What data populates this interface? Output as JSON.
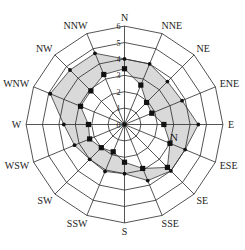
{
  "chart_data": {
    "type": "radar",
    "title": "",
    "categories": [
      "N",
      "NNE",
      "NE",
      "ENE",
      "E",
      "ESE",
      "SE",
      "SSE",
      "S",
      "SSW",
      "SW",
      "WSW",
      "W",
      "WNW",
      "NW",
      "NNW"
    ],
    "radial_ticks": [
      "0",
      "1",
      "2",
      "3",
      "4",
      "5",
      "6"
    ],
    "rlim": [
      0,
      6
    ],
    "grid": true,
    "grid_shape": "polygon",
    "series": [
      {
        "name": "outer (circle markers)",
        "marker": "circle",
        "values": [
          4.0,
          4.0,
          3.7,
          3.8,
          4.5,
          4.0,
          4.0,
          3.7,
          3.0,
          3.1,
          3.0,
          3.3,
          3.7,
          4.9,
          4.7,
          4.7
        ]
      },
      {
        "name": "inner (square markers)",
        "marker": "square",
        "values": [
          3.4,
          2.6,
          1.9,
          1.8,
          2.4,
          3.0,
          3.7,
          2.9,
          2.3,
          1.8,
          2.0,
          2.3,
          2.2,
          2.9,
          2.9,
          3.3
        ]
      }
    ],
    "fill_between_series": "#d9d9d9",
    "annotations": [
      {
        "text": "N",
        "position": "between E and ESE, inner area"
      }
    ]
  },
  "colors": {
    "grid": "#2a2a2a",
    "fill": "#d9d9d9",
    "marker": "#111111"
  }
}
